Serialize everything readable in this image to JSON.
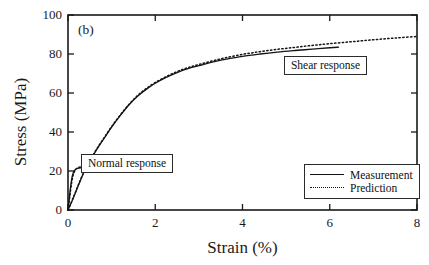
{
  "chart_data": {
    "type": "line",
    "title": "",
    "panel_label": "(b)",
    "xlabel": "Strain (%)",
    "ylabel": "Stress (MPa)",
    "xlim": [
      0,
      8
    ],
    "ylim": [
      0,
      100
    ],
    "xticks": [
      0,
      2,
      4,
      6,
      8
    ],
    "yticks": [
      0,
      20,
      40,
      60,
      80,
      100
    ],
    "grid": false,
    "legend_position": "lower right",
    "legend": [
      {
        "name": "Measurement",
        "style": "solid"
      },
      {
        "name": "Prediction",
        "style": "dotted"
      }
    ],
    "annotations": [
      {
        "text": "Normal response",
        "x": 1.35,
        "y": 24
      },
      {
        "text": "Shear response",
        "x": 5.9,
        "y": 74
      }
    ],
    "series": [
      {
        "name": "Shear response - Measurement",
        "style": "solid",
        "points": [
          [
            0.0,
            0.0
          ],
          [
            0.1,
            5.0
          ],
          [
            0.2,
            10.5
          ],
          [
            0.3,
            16.0
          ],
          [
            0.4,
            21.0
          ],
          [
            0.55,
            27.0
          ],
          [
            0.7,
            32.5
          ],
          [
            0.85,
            37.5
          ],
          [
            1.0,
            42.5
          ],
          [
            1.2,
            48.5
          ],
          [
            1.4,
            54.0
          ],
          [
            1.6,
            58.5
          ],
          [
            1.8,
            62.0
          ],
          [
            2.0,
            65.0
          ],
          [
            2.25,
            68.0
          ],
          [
            2.5,
            70.5
          ],
          [
            2.75,
            72.5
          ],
          [
            3.0,
            74.0
          ],
          [
            3.3,
            75.8
          ],
          [
            3.6,
            77.2
          ],
          [
            4.0,
            78.8
          ],
          [
            4.4,
            80.0
          ],
          [
            4.8,
            81.0
          ],
          [
            5.2,
            81.8
          ],
          [
            5.6,
            82.5
          ],
          [
            6.0,
            83.2
          ],
          [
            6.2,
            83.5
          ]
        ]
      },
      {
        "name": "Shear response - Prediction",
        "style": "dotted",
        "points": [
          [
            0.0,
            0.0
          ],
          [
            0.1,
            5.2
          ],
          [
            0.2,
            10.8
          ],
          [
            0.3,
            16.2
          ],
          [
            0.4,
            21.2
          ],
          [
            0.55,
            27.2
          ],
          [
            0.7,
            32.8
          ],
          [
            0.85,
            37.8
          ],
          [
            1.0,
            42.8
          ],
          [
            1.2,
            48.8
          ],
          [
            1.4,
            54.2
          ],
          [
            1.6,
            58.8
          ],
          [
            1.8,
            62.4
          ],
          [
            2.0,
            65.4
          ],
          [
            2.25,
            68.4
          ],
          [
            2.5,
            71.0
          ],
          [
            2.75,
            73.0
          ],
          [
            3.0,
            74.6
          ],
          [
            3.3,
            76.4
          ],
          [
            3.6,
            78.0
          ],
          [
            4.0,
            79.8
          ],
          [
            4.4,
            81.2
          ],
          [
            4.8,
            82.4
          ],
          [
            5.2,
            83.4
          ],
          [
            5.6,
            84.4
          ],
          [
            6.0,
            85.3
          ],
          [
            6.5,
            86.3
          ],
          [
            7.0,
            87.3
          ],
          [
            7.5,
            88.2
          ],
          [
            8.0,
            89.0
          ]
        ]
      },
      {
        "name": "Normal response - Measurement",
        "style": "solid",
        "points": [
          [
            0.0,
            0.0
          ],
          [
            0.03,
            6.0
          ],
          [
            0.06,
            12.0
          ],
          [
            0.09,
            16.5
          ],
          [
            0.12,
            19.0
          ],
          [
            0.16,
            20.5
          ],
          [
            0.2,
            21.2
          ],
          [
            0.26,
            21.5
          ],
          [
            0.33,
            21.7
          ],
          [
            0.42,
            21.9
          ],
          [
            0.52,
            22.1
          ],
          [
            0.62,
            22.3
          ],
          [
            0.72,
            22.5
          ],
          [
            0.8,
            22.6
          ]
        ]
      },
      {
        "name": "Normal response - Prediction",
        "style": "dotted",
        "points": [
          [
            0.0,
            0.0
          ],
          [
            0.04,
            7.0
          ],
          [
            0.08,
            13.5
          ],
          [
            0.12,
            18.0
          ],
          [
            0.17,
            20.6
          ],
          [
            0.22,
            21.6
          ],
          [
            0.3,
            22.2
          ],
          [
            0.4,
            22.8
          ],
          [
            0.5,
            23.3
          ],
          [
            0.6,
            23.8
          ],
          [
            0.7,
            24.2
          ],
          [
            0.8,
            24.5
          ]
        ]
      }
    ]
  },
  "axes": {
    "y_tick_labels": [
      "0",
      "20",
      "40",
      "60",
      "80",
      "100"
    ],
    "x_tick_labels": [
      "0",
      "2",
      "4",
      "6",
      "8"
    ]
  }
}
